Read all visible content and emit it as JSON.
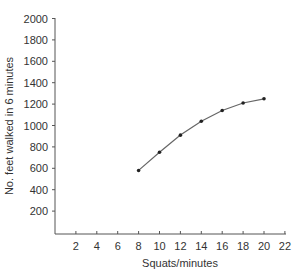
{
  "chart_data": {
    "type": "line",
    "title": "",
    "xlabel": "Squats/minutes",
    "ylabel": "No. feet walked in 6 minutes",
    "xlim": [
      0,
      22
    ],
    "ylim": [
      0,
      2000
    ],
    "x_ticks": [
      2,
      4,
      6,
      8,
      10,
      12,
      14,
      16,
      18,
      20,
      22
    ],
    "y_ticks": [
      200,
      400,
      600,
      800,
      1000,
      1200,
      1400,
      1600,
      1800,
      2000
    ],
    "grid": false,
    "legend": null,
    "series": [
      {
        "name": "Feet walked",
        "x": [
          8,
          10,
          12,
          14,
          16,
          18,
          20
        ],
        "values": [
          580,
          750,
          910,
          1040,
          1140,
          1210,
          1250
        ],
        "color": "#666666",
        "marker_color": "#222222"
      }
    ]
  }
}
